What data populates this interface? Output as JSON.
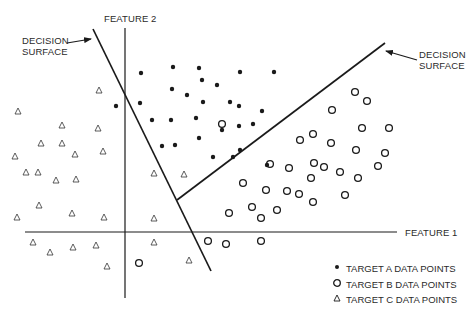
{
  "diagram": {
    "axes": {
      "feature1_label": "FEATURE 1",
      "feature2_label": "FEATURE 2"
    },
    "decision_surfaces": [
      {
        "label_line1": "DECISION",
        "label_line2": "SURFACE",
        "side": "left"
      },
      {
        "label_line1": "DECISION",
        "label_line2": "SURFACE",
        "side": "right"
      }
    ],
    "legend": [
      {
        "symbol": "filled-dot",
        "label": "TARGET A DATA POINTS"
      },
      {
        "symbol": "open-circle",
        "label": "TARGET B DATA POINTS"
      },
      {
        "symbol": "triangle",
        "label": "TARGET C DATA POINTS"
      }
    ],
    "colors": {
      "ink": "#1a1a1a",
      "background": "#ffffff"
    }
  },
  "chart_data": {
    "type": "scatter",
    "title": "",
    "xlabel": "FEATURE 1",
    "ylabel": "FEATURE 2",
    "grid": false,
    "legend_position": "bottom-right",
    "annotations": [
      "DECISION SURFACE (left line)",
      "DECISION SURFACE (right line)"
    ],
    "series": [
      {
        "name": "TARGET A DATA POINTS",
        "marker": "filled-dot",
        "points_px": [
          [
            141,
            73
          ],
          [
            173,
            67
          ],
          [
            199,
            68
          ],
          [
            202,
            80
          ],
          [
            217,
            85
          ],
          [
            240,
            72
          ],
          [
            274,
            72
          ],
          [
            172,
            89
          ],
          [
            187,
            95
          ],
          [
            203,
            102
          ],
          [
            230,
            102
          ],
          [
            239,
            106
          ],
          [
            262,
            111
          ],
          [
            152,
            120
          ],
          [
            171,
            120
          ],
          [
            196,
            118
          ],
          [
            222,
            130
          ],
          [
            239,
            126
          ],
          [
            253,
            124
          ],
          [
            162,
            146
          ],
          [
            175,
            145
          ],
          [
            199,
            138
          ],
          [
            233,
            157
          ],
          [
            240,
            150
          ],
          [
            116,
            106
          ],
          [
            140,
            103
          ],
          [
            213,
            157
          ],
          [
            267,
            165
          ]
        ]
      },
      {
        "name": "TARGET B DATA POINTS",
        "marker": "open-circle",
        "points_px": [
          [
            222,
            124
          ],
          [
            355,
            92
          ],
          [
            367,
            101
          ],
          [
            332,
            110
          ],
          [
            313,
            134
          ],
          [
            362,
            128
          ],
          [
            389,
            128
          ],
          [
            300,
            140
          ],
          [
            331,
            143
          ],
          [
            356,
            150
          ],
          [
            314,
            163
          ],
          [
            385,
            153
          ],
          [
            270,
            164
          ],
          [
            324,
            167
          ],
          [
            340,
            172
          ],
          [
            378,
            166
          ],
          [
            243,
            183
          ],
          [
            289,
            168
          ],
          [
            311,
            178
          ],
          [
            358,
            178
          ],
          [
            287,
            191
          ],
          [
            299,
            194
          ],
          [
            266,
            190
          ],
          [
            345,
            195
          ],
          [
            252,
            207
          ],
          [
            261,
            218
          ],
          [
            229,
            213
          ],
          [
            208,
            241
          ],
          [
            226,
            244
          ],
          [
            261,
            241
          ],
          [
            139,
            263
          ],
          [
            313,
            202
          ],
          [
            277,
            210
          ]
        ]
      },
      {
        "name": "TARGET C DATA POINTS",
        "marker": "triangle",
        "points_px": [
          [
            99,
            90
          ],
          [
            18,
            111
          ],
          [
            62,
            125
          ],
          [
            98,
            128
          ],
          [
            41,
            143
          ],
          [
            62,
            143
          ],
          [
            15,
            156
          ],
          [
            75,
            154
          ],
          [
            103,
            151
          ],
          [
            26,
            172
          ],
          [
            38,
            172
          ],
          [
            56,
            180
          ],
          [
            76,
            179
          ],
          [
            39,
            205
          ],
          [
            17,
            217
          ],
          [
            72,
            213
          ],
          [
            104,
            217
          ],
          [
            154,
            173
          ],
          [
            184,
            174
          ],
          [
            154,
            218
          ],
          [
            33,
            242
          ],
          [
            50,
            252
          ],
          [
            73,
            247
          ],
          [
            96,
            245
          ],
          [
            107,
            266
          ],
          [
            154,
            242
          ],
          [
            189,
            260
          ]
        ]
      }
    ],
    "lines_px": {
      "feature2_axis": [
        [
          125,
          28
        ],
        [
          125,
          298
        ]
      ],
      "feature1_axis": [
        [
          25,
          232
        ],
        [
          397,
          232
        ]
      ],
      "decision_surface_left": [
        [
          93,
          29
        ],
        [
          211,
          271
        ]
      ],
      "decision_surface_right": [
        [
          177,
          200
        ],
        [
          385,
          43
        ]
      ]
    }
  }
}
